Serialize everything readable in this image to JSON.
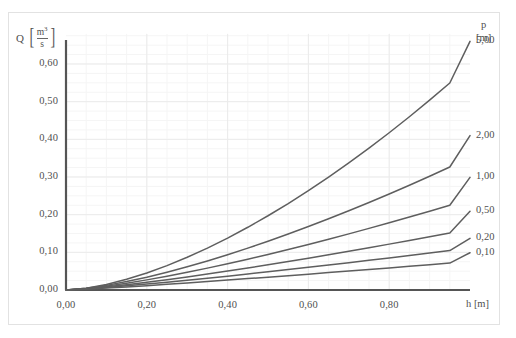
{
  "chart_data": {
    "type": "line",
    "title": "",
    "subtitle": "",
    "xlabel": "h [m]",
    "ylabel": "Q [m3/s]",
    "xlim": [
      0.0,
      1.0
    ],
    "ylim": [
      0.0,
      0.68
    ],
    "grid": true,
    "legend_position": "right",
    "x_ticks": [
      "0,00",
      "0,20",
      "0,40",
      "0,60",
      "0,80"
    ],
    "x_tick_values": [
      0.0,
      0.2,
      0.4,
      0.6,
      0.8
    ],
    "y_ticks": [
      "0,00",
      "0,10",
      "0,20",
      "0,30",
      "0,40",
      "0,50",
      "0,60"
    ],
    "y_tick_values": [
      0.0,
      0.1,
      0.2,
      0.3,
      0.4,
      0.5,
      0.6
    ],
    "legend_title": "p",
    "legend_unit": "[m]",
    "series": [
      {
        "name": "5,00",
        "color": "#5e5e5e",
        "x": [
          0.0,
          0.05,
          0.1,
          0.15,
          0.2,
          0.25,
          0.3,
          0.35,
          0.4,
          0.45,
          0.5,
          0.55,
          0.6,
          0.65,
          0.7,
          0.75,
          0.8,
          0.85,
          0.9,
          0.95,
          1.0
        ],
        "y": [
          0.0,
          0.0047,
          0.0147,
          0.0284,
          0.0452,
          0.0648,
          0.0869,
          0.1113,
          0.1379,
          0.1665,
          0.1971,
          0.2295,
          0.2637,
          0.2997,
          0.3373,
          0.3766,
          0.4175,
          0.46,
          0.504,
          0.5495,
          0.66
        ]
      },
      {
        "name": "2,00",
        "color": "#5e5e5e",
        "x": [
          0.0,
          0.05,
          0.1,
          0.15,
          0.2,
          0.25,
          0.3,
          0.35,
          0.4,
          0.45,
          0.5,
          0.55,
          0.6,
          0.65,
          0.7,
          0.75,
          0.8,
          0.85,
          0.9,
          0.95,
          1.0
        ],
        "y": [
          0.0,
          0.0044,
          0.0123,
          0.0224,
          0.0341,
          0.0473,
          0.0617,
          0.0772,
          0.0937,
          0.1111,
          0.1294,
          0.1485,
          0.1684,
          0.189,
          0.2103,
          0.2323,
          0.2549,
          0.2782,
          0.302,
          0.3265,
          0.41
        ]
      },
      {
        "name": "1,00",
        "color": "#5e5e5e",
        "x": [
          0.0,
          0.05,
          0.1,
          0.15,
          0.2,
          0.25,
          0.3,
          0.35,
          0.4,
          0.45,
          0.5,
          0.55,
          0.6,
          0.65,
          0.7,
          0.75,
          0.8,
          0.85,
          0.9,
          0.95,
          1.0
        ],
        "y": [
          0.0,
          0.0039,
          0.0103,
          0.0181,
          0.0269,
          0.0366,
          0.047,
          0.0581,
          0.0697,
          0.0818,
          0.0944,
          0.1075,
          0.1209,
          0.1348,
          0.149,
          0.1636,
          0.1785,
          0.1937,
          0.2092,
          0.225,
          0.299
        ]
      },
      {
        "name": "0,50",
        "color": "#5e5e5e",
        "x": [
          0.0,
          0.05,
          0.1,
          0.15,
          0.2,
          0.25,
          0.3,
          0.35,
          0.4,
          0.45,
          0.5,
          0.55,
          0.6,
          0.65,
          0.7,
          0.75,
          0.8,
          0.85,
          0.9,
          0.95,
          1.0
        ],
        "y": [
          0.0,
          0.0033,
          0.0083,
          0.0141,
          0.0205,
          0.0274,
          0.0347,
          0.0423,
          0.0503,
          0.0585,
          0.0669,
          0.0756,
          0.0845,
          0.0935,
          0.1028,
          0.1122,
          0.1218,
          0.1315,
          0.1414,
          0.1514,
          0.209
        ]
      },
      {
        "name": "0,20",
        "color": "#5e5e5e",
        "x": [
          0.0,
          0.05,
          0.1,
          0.15,
          0.2,
          0.25,
          0.3,
          0.35,
          0.4,
          0.45,
          0.5,
          0.55,
          0.6,
          0.65,
          0.7,
          0.75,
          0.8,
          0.85,
          0.9,
          0.95,
          1.0
        ],
        "y": [
          0.0,
          0.0027,
          0.0066,
          0.011,
          0.0157,
          0.0207,
          0.0259,
          0.0313,
          0.0368,
          0.0425,
          0.0483,
          0.0542,
          0.0602,
          0.0663,
          0.0725,
          0.0788,
          0.0852,
          0.0916,
          0.0981,
          0.1047,
          0.137
        ]
      },
      {
        "name": "0,10",
        "color": "#5e5e5e",
        "x": [
          0.0,
          0.05,
          0.1,
          0.15,
          0.2,
          0.25,
          0.3,
          0.35,
          0.4,
          0.45,
          0.5,
          0.55,
          0.6,
          0.65,
          0.7,
          0.75,
          0.8,
          0.85,
          0.9,
          0.95,
          1.0
        ],
        "y": [
          0.0,
          0.0021,
          0.005,
          0.0082,
          0.0116,
          0.0151,
          0.0188,
          0.0225,
          0.0263,
          0.0302,
          0.0341,
          0.0381,
          0.0421,
          0.0462,
          0.0503,
          0.0545,
          0.0587,
          0.0629,
          0.0672,
          0.0715,
          0.099
        ]
      }
    ]
  },
  "axes": {
    "y_title_symbol": "Q",
    "y_unit_numerator": "m",
    "y_unit_numerator_exp": "3",
    "y_unit_denominator": "s",
    "x_title": "h [m]"
  },
  "legend": {
    "title": "p",
    "unit": "[m]"
  },
  "colors": {
    "curve": "#5e5e5e",
    "axis": "#555555",
    "grid_major": "#ebebeb",
    "grid_minor": "#f5f5f5",
    "frame": "#e2e2e2",
    "text": "#4f4f4f",
    "background": "#ffffff"
  }
}
